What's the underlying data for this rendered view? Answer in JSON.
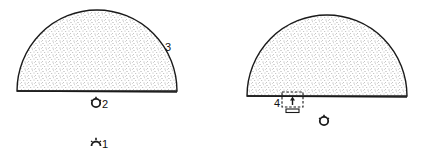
{
  "colors": {
    "ink": "#1a1a1a",
    "fill": "#ffffff",
    "stipple": "#555555",
    "background": "#ffffff"
  },
  "left_panel": {
    "dome_label": "3",
    "lower_source_label": "1",
    "upper_source_label": "2"
  },
  "right_panel": {
    "window_label": "4"
  }
}
